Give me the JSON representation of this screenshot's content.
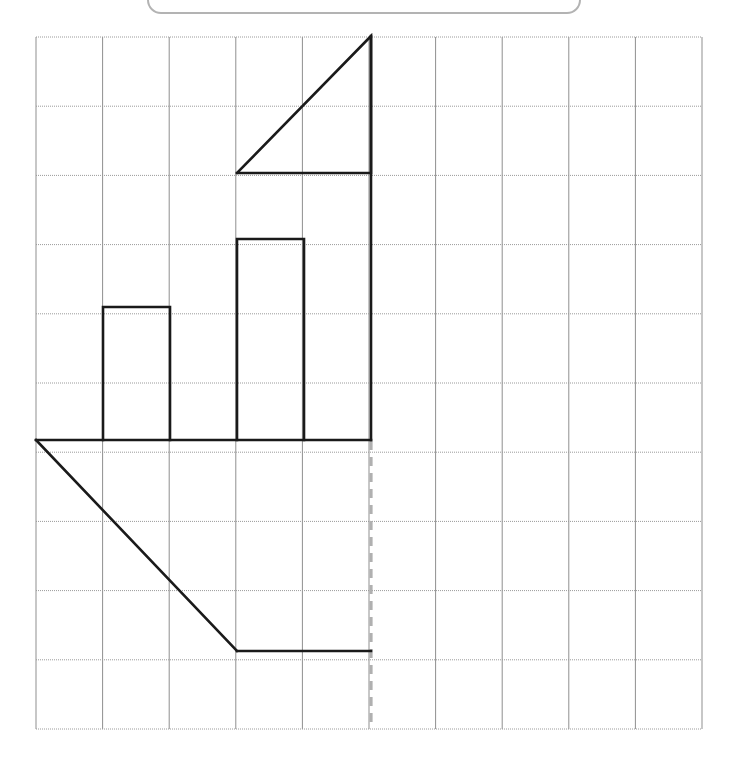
{
  "page": {
    "width": 731,
    "height": 760,
    "background": "#ffffff"
  },
  "top_panel": {
    "name": "rounded-panel",
    "border_color": "#b3b3b3",
    "border_radius": 14,
    "x": 147,
    "y": -48,
    "width": 434,
    "height": 62,
    "label": ""
  },
  "grid": {
    "origin_x": 36,
    "origin_y": 37,
    "cell_width": 66.6,
    "cell_height": 69.2,
    "columns": 10,
    "rows": 10,
    "right_x": 702,
    "bottom_y": 729,
    "vertical_line_color": "#8f8f8f",
    "horizontal_line_color": "#9a9a9a",
    "vertical_line_width": 1,
    "horizontal_line_width": 1,
    "horizontal_dash": "1,1"
  },
  "figure": {
    "stroke_color": "#1a1a1a",
    "stroke_width": 2.6,
    "dashed_stroke_color": "#b0b0b0",
    "dashed_stroke_width": 3.2,
    "dash_pattern": "9,7",
    "parts": [
      {
        "name": "upper-triangle",
        "type": "polyline",
        "points": "237,173 371,173 371,36 237,173",
        "description": "Right triangle with apex at top right, base on row line"
      },
      {
        "name": "bar-left",
        "type": "polyline",
        "points": "103,440 103,307 170,307 170,440",
        "description": "Left vertical bar, 1 column wide, 2 rows tall"
      },
      {
        "name": "bar-right",
        "type": "polyline",
        "points": "237,440 237,239 304,239 304,440",
        "description": "Right vertical bar, 1 column wide, 3 rows tall"
      },
      {
        "name": "baseline",
        "type": "polyline",
        "points": "36,440 371,440",
        "description": "Horizontal baseline spanning 5 columns"
      },
      {
        "name": "right-vertical-edge",
        "type": "polyline",
        "points": "371,36 371,440",
        "description": "Tall vertical right edge of figure"
      },
      {
        "name": "lower-diagonal",
        "type": "polyline",
        "points": "36,440 237,651",
        "description": "Diagonal descending from left baseline end"
      },
      {
        "name": "lower-base",
        "type": "polyline",
        "points": "237,651 371,651",
        "description": "Horizontal bottom edge"
      }
    ],
    "dashed_parts": [
      {
        "name": "axis-of-symmetry-dashed-line",
        "type": "polyline",
        "points": "371,441 371,729",
        "description": "Vertical dashed gray line continuing below baseline"
      }
    ]
  },
  "chart_data": {
    "type": "table",
    "grid_units": {
      "columns": 10,
      "rows": 10
    },
    "shapes": [
      {
        "name": "upper-triangle",
        "vertices_units": [
          [
            3,
            2
          ],
          [
            5,
            2
          ],
          [
            5,
            0
          ]
        ]
      },
      {
        "name": "bar-left",
        "vertices_units": [
          [
            1,
            6
          ],
          [
            1,
            4
          ],
          [
            2,
            4
          ],
          [
            2,
            6
          ]
        ]
      },
      {
        "name": "bar-right",
        "vertices_units": [
          [
            3,
            6
          ],
          [
            3,
            3
          ],
          [
            4,
            3
          ],
          [
            4,
            6
          ]
        ]
      },
      {
        "name": "lower-trapezoid",
        "vertices_units": [
          [
            0,
            6
          ],
          [
            5,
            6
          ],
          [
            5,
            9
          ],
          [
            3,
            9
          ]
        ]
      }
    ],
    "dashed_line_units": [
      [
        5,
        6
      ],
      [
        5,
        10
      ]
    ]
  }
}
